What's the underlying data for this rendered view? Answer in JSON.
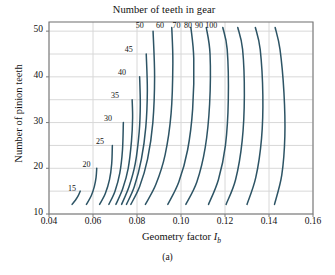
{
  "figure": {
    "caption": "(a)",
    "top_title": "Number of teeth in gear",
    "xlabel_main": "Geometry factor ",
    "xlabel_sym": "I",
    "xlabel_sub": "b",
    "ylabel": "Number of pinion teeth"
  },
  "colors": {
    "curve": "#2d5465",
    "grid": "#d8d8d8",
    "frame": "#7a7a7a",
    "text": "#111111",
    "background": "#ffffff"
  },
  "chart_data": {
    "type": "line",
    "title": "Number of teeth in gear",
    "xlabel": "Geometry factor I_b",
    "ylabel": "Number of pinion teeth",
    "xlim": [
      0.04,
      0.16
    ],
    "ylim": [
      10,
      52
    ],
    "xticks": [
      "0.04",
      "0.06",
      "0.08",
      "0.10",
      "0.12",
      "0.14",
      "0.16"
    ],
    "xtick_values": [
      0.04,
      0.06,
      0.08,
      0.1,
      0.12,
      0.14,
      0.16
    ],
    "yticks": [
      "10",
      "20",
      "30",
      "40",
      "50"
    ],
    "ytick_values": [
      10,
      20,
      30,
      40,
      50
    ],
    "grid": true,
    "legend": "inline-curve-labels",
    "series": [
      {
        "name": "15",
        "label": "15",
        "label_xy": [
          0.0505,
          15.3
        ],
        "points": [
          [
            0.0505,
            12.1
          ],
          [
            0.052,
            13.0
          ],
          [
            0.0533,
            14.0
          ],
          [
            0.0542,
            15.0
          ]
        ]
      },
      {
        "name": "20",
        "label": "20",
        "label_xy": [
          0.057,
          20.6
        ],
        "points": [
          [
            0.057,
            12.1
          ],
          [
            0.0592,
            14.0
          ],
          [
            0.0606,
            16.0
          ],
          [
            0.0614,
            18.0
          ],
          [
            0.0617,
            20.0
          ]
        ]
      },
      {
        "name": "25",
        "label": "25",
        "label_xy": [
          0.0632,
          25.6
        ],
        "points": [
          [
            0.063,
            12.1
          ],
          [
            0.0656,
            14.5
          ],
          [
            0.0675,
            17.5
          ],
          [
            0.0685,
            21.0
          ],
          [
            0.0688,
            25.0
          ]
        ]
      },
      {
        "name": "30",
        "label": "30",
        "label_xy": [
          0.0668,
          30.6
        ],
        "points": [
          [
            0.0672,
            12.1
          ],
          [
            0.07,
            15.0
          ],
          [
            0.0722,
            19.0
          ],
          [
            0.0734,
            24.0
          ],
          [
            0.0738,
            30.0
          ]
        ]
      },
      {
        "name": "35",
        "label": "35",
        "label_xy": [
          0.07,
          35.6
        ],
        "points": [
          [
            0.0704,
            12.1
          ],
          [
            0.0735,
            15.5
          ],
          [
            0.076,
            20.0
          ],
          [
            0.0775,
            26.0
          ],
          [
            0.078,
            31.0
          ],
          [
            0.0778,
            35.0
          ]
        ]
      },
      {
        "name": "40",
        "label": "40",
        "label_xy": [
          0.0732,
          40.6
        ],
        "points": [
          [
            0.073,
            12.1
          ],
          [
            0.0764,
            16.0
          ],
          [
            0.0792,
            21.0
          ],
          [
            0.081,
            28.0
          ],
          [
            0.0815,
            34.0
          ],
          [
            0.0812,
            40.0
          ]
        ]
      },
      {
        "name": "45",
        "label": "45",
        "label_xy": [
          0.0762,
          45.6
        ],
        "points": [
          [
            0.0752,
            12.1
          ],
          [
            0.0788,
            16.0
          ],
          [
            0.082,
            22.0
          ],
          [
            0.084,
            29.0
          ],
          [
            0.0847,
            37.0
          ],
          [
            0.0842,
            45.0
          ]
        ]
      },
      {
        "name": "50",
        "label": "50",
        "label_xy": [
          0.0812,
          50.8
        ],
        "points": [
          [
            0.0772,
            12.1
          ],
          [
            0.0812,
            16.0
          ],
          [
            0.0848,
            22.0
          ],
          [
            0.0872,
            30.0
          ],
          [
            0.088,
            40.0
          ],
          [
            0.0873,
            50.0
          ]
        ]
      },
      {
        "name": "60",
        "label": "60",
        "label_xy": [
          0.0905,
          50.8
        ],
        "points": [
          [
            0.0838,
            12.1
          ],
          [
            0.0886,
            16.5
          ],
          [
            0.0928,
            23.0
          ],
          [
            0.0955,
            32.0
          ],
          [
            0.0963,
            43.0
          ],
          [
            0.0958,
            50.8
          ]
        ]
      },
      {
        "name": "70",
        "label": "70",
        "label_xy": [
          0.098,
          50.8
        ],
        "points": [
          [
            0.094,
            12.1
          ],
          [
            0.099,
            17.0
          ],
          [
            0.103,
            24.0
          ],
          [
            0.1053,
            33.0
          ],
          [
            0.1058,
            44.0
          ],
          [
            0.1045,
            50.8
          ]
        ]
      },
      {
        "name": "80",
        "label": "80",
        "label_xy": [
          0.1032,
          50.8
        ],
        "points": [
          [
            0.1022,
            12.1
          ],
          [
            0.1072,
            17.0
          ],
          [
            0.111,
            24.5
          ],
          [
            0.113,
            34.0
          ],
          [
            0.1132,
            45.0
          ],
          [
            0.1115,
            50.8
          ]
        ]
      },
      {
        "name": "90",
        "label": "90",
        "label_xy": [
          0.1082,
          50.8
        ],
        "points": [
          [
            0.1125,
            12.1
          ],
          [
            0.117,
            17.5
          ],
          [
            0.1202,
            25.0
          ],
          [
            0.1215,
            35.0
          ],
          [
            0.121,
            46.0
          ],
          [
            0.119,
            50.8
          ]
        ]
      },
      {
        "name": "100",
        "label": "100",
        "label_xy": [
          0.1138,
          50.8
        ],
        "points": [
          [
            0.1205,
            12.1
          ],
          [
            0.1248,
            17.5
          ],
          [
            0.1278,
            26.0
          ],
          [
            0.1288,
            36.0
          ],
          [
            0.128,
            46.0
          ],
          [
            0.1258,
            50.8
          ]
        ]
      },
      {
        "name": "110",
        "label": "",
        "label_xy": [
          0.0,
          0.0
        ],
        "points": [
          [
            0.13,
            12.1
          ],
          [
            0.134,
            18.0
          ],
          [
            0.1366,
            26.5
          ],
          [
            0.1372,
            36.0
          ],
          [
            0.136,
            46.0
          ],
          [
            0.1338,
            50.8
          ]
        ]
      },
      {
        "name": "120",
        "label": "",
        "label_xy": [
          0.0,
          0.0
        ],
        "points": [
          [
            0.1425,
            12.1
          ],
          [
            0.1458,
            18.5
          ],
          [
            0.1472,
            27.0
          ],
          [
            0.1468,
            36.5
          ],
          [
            0.145,
            46.0
          ],
          [
            0.1428,
            50.8
          ]
        ]
      }
    ]
  }
}
